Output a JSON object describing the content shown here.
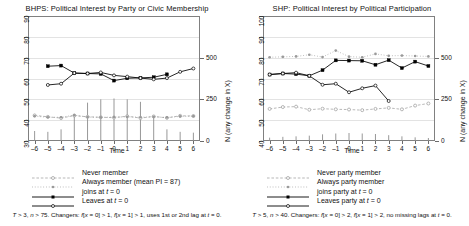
{
  "figure": {
    "panels": [
      {
        "id": "bhps",
        "title": "BHPS: Political Interest by Party or Civic Membership",
        "footnote": "T > 3, n > 75. Changers: f[x = 0] > 1, f[x = 1] > 1, uses 1st or 2nd lag at t = 0.",
        "legend": [
          {
            "label": "Never member",
            "key": "open-circle-dashed-grey"
          },
          {
            "label": "Always member (mean PI = 87)",
            "key": "filled-circle-dotted-grey"
          },
          {
            "label": "joins at t = 0",
            "key": "filled-square-solid-black"
          },
          {
            "label": "Leaves at t = 0",
            "key": "open-circle-solid-black"
          }
        ],
        "chart_data": {
          "type": "line",
          "title": "BHPS: Political Interest by Party or Civic Membership",
          "xlabel": "Time",
          "ylabel": "",
          "y2label": "N (any change in X)",
          "xlim": [
            -6.5,
            6.5
          ],
          "ylim": [
            30,
            90
          ],
          "y2lim": [
            0,
            750
          ],
          "yticks": [
            30,
            40,
            50,
            60,
            70,
            80,
            90
          ],
          "y2ticks": [
            0,
            250,
            500
          ],
          "xticks": [
            -6,
            -5,
            -4,
            -3,
            -2,
            -1,
            0,
            1,
            2,
            3,
            4,
            5,
            6
          ],
          "grid": true,
          "legend_position": "below",
          "x": [
            -6,
            -5,
            -4,
            -3,
            -2,
            -1,
            0,
            1,
            2,
            3,
            4,
            5,
            6
          ],
          "series": [
            {
              "name": "Never member",
              "marker": "open-circle",
              "line": "dashed",
              "color": "#9a9a9a",
              "values": [
                42.3,
                41.6,
                41.0,
                42.2,
                41.6,
                41.4,
                41.2,
                41.9,
                41.0,
                41.8,
                41.1,
                42.1,
                42.0
              ]
            },
            {
              "name": "Always member (mean PI = 87)",
              "marker": "filled-circle-small",
              "line": "dotted",
              "color": "#9a9a9a",
              "values": [
                41.9,
                41.4,
                41.4,
                42.4,
                41.5,
                41.3,
                41.5,
                41.6,
                41.4,
                41.6,
                41.3,
                41.8,
                41.9
              ]
            },
            {
              "name": "joins at t = 0",
              "marker": "filled-square",
              "line": "solid",
              "color": "#000000",
              "values": [
                null,
                65.9,
                66.2,
                62.6,
                62.4,
                62.2,
                59.0,
                60.1,
                60.3,
                60.6,
                62.0,
                null,
                null
              ]
            },
            {
              "name": "Leaves at t = 0",
              "marker": "open-circle",
              "line": "solid",
              "color": "#000000",
              "values": [
                null,
                56.9,
                57.5,
                62.6,
                62.4,
                62.9,
                61.5,
                60.9,
                60.2,
                59.6,
                60.2,
                63.2,
                64.8
              ]
            }
          ],
          "bars": {
            "name": "N (any change in X)",
            "color": "#8c8c8c",
            "values": [
              60,
              55,
              70,
              150,
              230,
              250,
              255,
              250,
              235,
              150,
              70,
              55,
              50
            ]
          }
        }
      },
      {
        "id": "shp",
        "title": "SHP: Political Interest by Political Participation",
        "footnote": "T > 5, n > 40. Changers: f[x = 0] > 2, f[x = 1] > 2, no missing lags at t = 0.",
        "legend": [
          {
            "label": "Never party member",
            "key": "open-circle-dashed-grey"
          },
          {
            "label": "Always party member",
            "key": "filled-circle-dotted-grey"
          },
          {
            "label": "joins party at t = 0",
            "key": "filled-square-solid-black"
          },
          {
            "label": "Leaves party at t = 0",
            "key": "open-circle-solid-black"
          }
        ],
        "chart_data": {
          "type": "line",
          "title": "SHP: Political Interest by Political Participation",
          "xlabel": "Time",
          "ylabel": "",
          "y2label": "N (any change in X)",
          "xlim": [
            -6.5,
            6.5
          ],
          "ylim": [
            40,
            100
          ],
          "y2lim": [
            0,
            750
          ],
          "yticks": [
            40,
            50,
            60,
            70,
            80,
            90,
            100
          ],
          "y2ticks": [
            0,
            250,
            500
          ],
          "xticks": [
            -6,
            -5,
            -4,
            -3,
            -2,
            -1,
            0,
            1,
            2,
            3,
            4,
            5,
            6
          ],
          "grid": true,
          "legend_position": "below",
          "x": [
            -6,
            -5,
            -4,
            -3,
            -2,
            -1,
            0,
            1,
            2,
            3,
            4,
            5,
            6
          ],
          "series": [
            {
              "name": "Never party member",
              "marker": "open-circle",
              "line": "dashed",
              "color": "#9a9a9a",
              "values": [
                55.4,
                56.3,
                56.5,
                55.0,
                55.5,
                55.2,
                55.1,
                54.8,
                55.4,
                55.9,
                55.2,
                57.0,
                58.0
              ]
            },
            {
              "name": "Always party member",
              "marker": "filled-circle-small",
              "line": "dotted",
              "color": "#9a9a9a",
              "values": [
                80.2,
                80.4,
                80.6,
                81.4,
                80.3,
                83.4,
                80.5,
                80.2,
                81.8,
                80.9,
                81.0,
                80.8,
                80.6
              ]
            },
            {
              "name": "joins party at t = 0",
              "marker": "filled-square",
              "line": "solid",
              "color": "#000000",
              "values": [
                71.9,
                72.4,
                72.1,
                71.3,
                74.0,
                78.7,
                78.6,
                78.5,
                76.6,
                78.8,
                75.0,
                78.1,
                76.0
              ]
            },
            {
              "name": "Leaves party at t = 0",
              "marker": "open-circle",
              "line": "solid",
              "color": "#000000",
              "values": [
                71.9,
                72.4,
                72.8,
                71.3,
                67.0,
                67.5,
                63.4,
                65.3,
                66.6,
                59.2,
                null,
                null,
                null
              ]
            }
          ],
          "bars": {
            "name": "N (any change in X)",
            "color": "#8c8c8c",
            "values": [
              20,
              25,
              28,
              32,
              40,
              45,
              48,
              45,
              42,
              35,
              28,
              22,
              18
            ]
          }
        }
      }
    ]
  }
}
